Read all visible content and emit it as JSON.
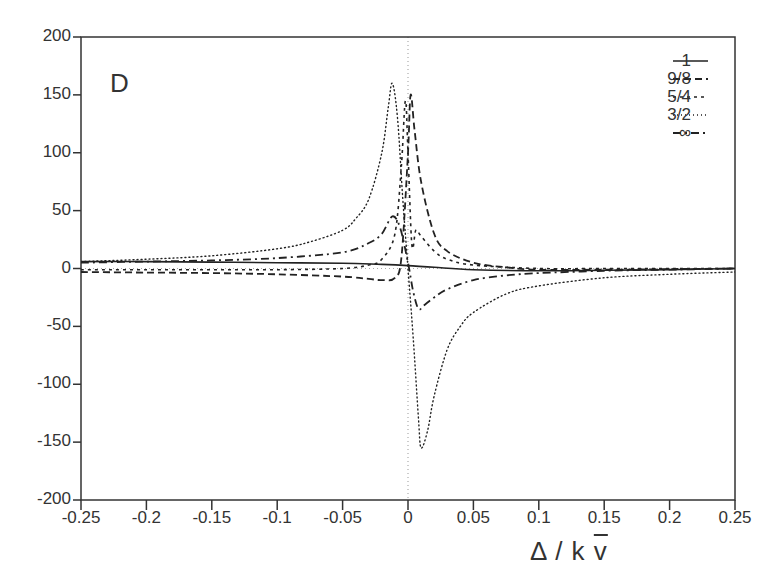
{
  "chart_data": {
    "type": "line",
    "title": "",
    "panel_label": "D",
    "xlabel": "Δ / k v̄",
    "xlabel_parts": {
      "prefix": "Δ / k ",
      "vbar": "v"
    },
    "ylabel": "",
    "xlim": [
      -0.25,
      0.25
    ],
    "ylim": [
      -200,
      200
    ],
    "grid": false,
    "legend_position": "upper right",
    "x_ticks": [
      "-0.25",
      "-0.2",
      "-0.15",
      "-0.1",
      "-0.05",
      "0",
      "0.05",
      "0.1",
      "0.15",
      "0.2",
      "0.25"
    ],
    "y_ticks": [
      "200",
      "150",
      "100",
      "50",
      "0",
      "-50",
      "-100",
      "-150",
      "-200"
    ],
    "reference_lines": [
      {
        "orientation": "vertical",
        "x": 0,
        "style": "dotted"
      },
      {
        "orientation": "horizontal",
        "y": 0,
        "style": "dotted"
      }
    ],
    "series": [
      {
        "name": "1",
        "style": "solid",
        "x": [
          -0.25,
          -0.2,
          -0.15,
          -0.1,
          -0.05,
          -0.02,
          0,
          0.02,
          0.05,
          0.1,
          0.15,
          0.2,
          0.25
        ],
        "y": [
          6,
          6,
          5.5,
          5,
          4.5,
          3.5,
          2.5,
          1,
          -1,
          -2,
          -1.5,
          -1,
          0
        ]
      },
      {
        "name": "9/8",
        "style": "dashed",
        "x": [
          -0.25,
          -0.2,
          -0.15,
          -0.1,
          -0.05,
          -0.03,
          -0.02,
          -0.01,
          -0.005,
          0,
          0.002,
          0.005,
          0.01,
          0.02,
          0.03,
          0.05,
          0.075,
          0.1,
          0.15,
          0.2,
          0.25
        ],
        "y": [
          -3,
          -3.5,
          -4,
          -5,
          -7,
          -9,
          -10,
          -8,
          10,
          100,
          150,
          120,
          75,
          30,
          15,
          5,
          1,
          -1,
          -1,
          -0.5,
          0
        ]
      },
      {
        "name": "5/4",
        "style": "short-dashed",
        "x": [
          -0.25,
          -0.2,
          -0.15,
          -0.1,
          -0.05,
          -0.03,
          -0.02,
          -0.01,
          -0.005,
          -0.002,
          0,
          0.003,
          0.006,
          0.01,
          0.02,
          0.03,
          0.05,
          0.1,
          0.15,
          0.2,
          0.25
        ],
        "y": [
          -1,
          -1,
          -1,
          -1,
          0,
          3,
          8,
          30,
          90,
          145,
          100,
          20,
          33,
          28,
          15,
          8,
          3,
          0,
          0,
          0,
          0
        ]
      },
      {
        "name": "3/2",
        "style": "dotted",
        "x": [
          -0.25,
          -0.2,
          -0.15,
          -0.1,
          -0.075,
          -0.05,
          -0.04,
          -0.03,
          -0.02,
          -0.015,
          -0.012,
          -0.008,
          -0.004,
          0,
          0.004,
          0.008,
          0.01,
          0.015,
          0.02,
          0.03,
          0.04,
          0.05,
          0.075,
          0.1,
          0.15,
          0.2,
          0.25
        ],
        "y": [
          6,
          8,
          11,
          17,
          23,
          33,
          43,
          60,
          100,
          140,
          160,
          130,
          60,
          0,
          -60,
          -130,
          -155,
          -140,
          -110,
          -70,
          -50,
          -38,
          -22,
          -15,
          -8,
          -5,
          -3
        ]
      },
      {
        "name": "∞",
        "style": "dash-dot",
        "x": [
          -0.25,
          -0.2,
          -0.15,
          -0.1,
          -0.05,
          -0.03,
          -0.02,
          -0.012,
          -0.006,
          0,
          0.004,
          0.008,
          0.012,
          0.02,
          0.03,
          0.05,
          0.075,
          0.1,
          0.15,
          0.2,
          0.25
        ],
        "y": [
          5,
          6,
          7,
          9,
          14,
          22,
          30,
          45,
          35,
          5,
          -20,
          -35,
          -32,
          -25,
          -18,
          -10,
          -6,
          -4,
          -2,
          -1,
          0
        ]
      }
    ]
  },
  "legend": {
    "entries": [
      {
        "label": "1",
        "style": "solid"
      },
      {
        "label": "9/8",
        "style": "dashed"
      },
      {
        "label": "5/4",
        "style": "short-dashed"
      },
      {
        "label": "3/2",
        "style": "dotted"
      },
      {
        "label": "∞",
        "style": "dash-dot"
      }
    ]
  }
}
